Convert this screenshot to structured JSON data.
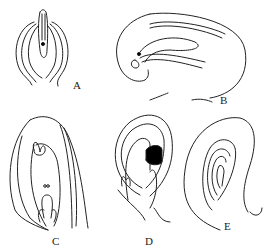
{
  "figure": {
    "panels": [
      {
        "id": "A",
        "label": "A",
        "description": "orthotropous ovule"
      },
      {
        "id": "B",
        "label": "B",
        "description": "campylotropous ovule"
      },
      {
        "id": "C",
        "label": "C",
        "description": "anatropous ovule with embryo sac"
      },
      {
        "id": "D",
        "label": "D",
        "description": "curved ovule with dark chalazal tissue"
      },
      {
        "id": "E",
        "label": "E",
        "description": "circinotropous ovule"
      }
    ],
    "colors": {
      "line": "#222222",
      "background": "#ffffff",
      "fill_dark": "#000000"
    }
  }
}
